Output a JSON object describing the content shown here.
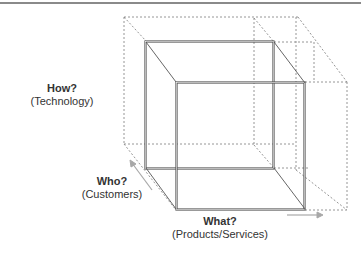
{
  "diagram": {
    "type": "3d-cube-framework",
    "axes": [
      {
        "id": "how",
        "title": "How?",
        "subtitle": "(Technology)",
        "direction": "vertical"
      },
      {
        "id": "who",
        "title": "Who?",
        "subtitle": "(Customers)",
        "direction": "depth"
      },
      {
        "id": "what",
        "title": "What?",
        "subtitle": "(Products/Services)",
        "direction": "horizontal"
      }
    ],
    "colors": {
      "solid_edge": "#555555",
      "dashed_edge": "#8a8a8a",
      "arrow": "#a8a8a8",
      "text": "#333333"
    }
  },
  "labels": {
    "how": {
      "title": "How?",
      "subtitle": "(Technology)"
    },
    "who": {
      "title": "Who?",
      "subtitle": "(Customers)"
    },
    "what": {
      "title": "What?",
      "subtitle": "(Products/Services)"
    }
  }
}
